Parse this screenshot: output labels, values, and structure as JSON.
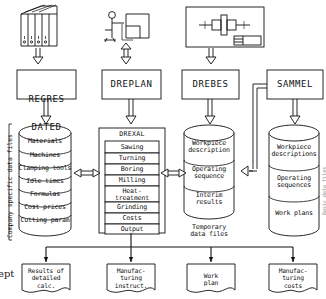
{
  "diagram": {
    "margin_fragment_left": "ept",
    "edge_fragment_right": "Basic data files",
    "colors": {
      "line": "#111111",
      "background": "#ffffff",
      "faint": "#8a8a8a"
    },
    "inputs": [
      {
        "icon": "binders-on-shelf-icon",
        "name": "document-binders-input"
      },
      {
        "icon": "person-at-desk-icon",
        "name": "operator-terminal-input"
      },
      {
        "icon": "engineering-drawing-icon",
        "name": "technical-drawing-input"
      }
    ],
    "programs": [
      {
        "label_line1": "REGRES",
        "label_line2": "DATED",
        "name": "program-regres-dated"
      },
      {
        "label_line1": "DREPLAN",
        "label_line2": "",
        "name": "program-dreplan"
      },
      {
        "label_line1": "DREBES",
        "label_line2": "",
        "name": "program-drebes"
      },
      {
        "label_line1": "SAMMEL",
        "label_line2": "",
        "name": "program-sammel"
      }
    ],
    "store_1": {
      "name": "company-specific-data-store",
      "side_label": "Company specific data files",
      "cells": [
        "Materials",
        "Machines",
        "Clamping tools",
        "Idle times",
        "Formulas",
        "Cost prices",
        "Cutting param"
      ]
    },
    "drexal": {
      "name": "drexal-module-box",
      "title": "DREXAL",
      "cells": [
        "Sawing",
        "Turning",
        "Boring",
        "Milling",
        "Heat-\ntreatment",
        "Grinding",
        "Costs",
        "Output"
      ]
    },
    "store_2": {
      "name": "temporary-data-store",
      "caption": "Temporary\ndata files",
      "cells": [
        "Workpiece\ndescription",
        "Operating\nsequence",
        "Interim\nresults"
      ]
    },
    "store_3": {
      "name": "work-plan-data-store",
      "cells": [
        "Workpiece\ndescriptions",
        "Operating\nsequences",
        "Work plans"
      ]
    },
    "outputs": [
      {
        "text": "Results of\ndetailed\ncalc.",
        "name": "output-detailed-calc"
      },
      {
        "text": "Manufac-\nturing\ninstruct.",
        "name": "output-manufacturing-instructions"
      },
      {
        "text": "Work\nplan",
        "name": "output-work-plan"
      },
      {
        "text": "Manufac-\nturing\ncosts",
        "name": "output-manufacturing-costs"
      }
    ]
  }
}
